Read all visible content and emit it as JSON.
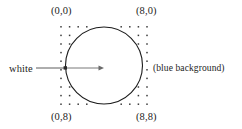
{
  "figure": {
    "corners": {
      "top_left": "(0,0)",
      "top_right": "(8,0)",
      "bottom_left": "(0,8)",
      "bottom_right": "(8,8)"
    },
    "annotations": {
      "seed_label": "white",
      "background_label": "(blue background)"
    },
    "colors": {
      "dot": "#3a3a3a",
      "outline": "#1c1c1c",
      "arrow": "#6a6a6a",
      "leader": "#4a4a4a",
      "page_background": "#ffffff"
    }
  },
  "chart_data": {
    "type": "scatter",
    "xlabel": "",
    "ylabel": "",
    "xlim": [
      0,
      8
    ],
    "ylim": [
      0,
      8
    ],
    "grid": false,
    "legend": "none",
    "grid_columns": 9,
    "grid_rows": 9,
    "x": [
      0,
      1,
      2,
      3,
      4,
      5,
      6,
      7,
      8
    ],
    "y": [
      0,
      1,
      2,
      3,
      4,
      5,
      6,
      7,
      8
    ],
    "shapes": [
      {
        "kind": "circle",
        "center": [
          4,
          4
        ],
        "radius": 4.0,
        "stroke": "#1c1c1c",
        "fill": "none"
      }
    ],
    "annotations": [
      {
        "text": "(0,0)",
        "x": 0,
        "y": 0,
        "position": "above-left"
      },
      {
        "text": "(8,0)",
        "x": 8,
        "y": 0,
        "position": "above-right"
      },
      {
        "text": "(0,8)",
        "x": 0,
        "y": 8,
        "position": "below-left"
      },
      {
        "text": "(8,8)",
        "x": 8,
        "y": 8,
        "position": "below-right"
      },
      {
        "text": "white",
        "x": 0,
        "y": 4,
        "position": "left",
        "arrow_to": [
          4,
          4
        ]
      },
      {
        "text": "(blue background)",
        "x": 8,
        "y": 4,
        "position": "right"
      }
    ],
    "seed_point": {
      "x": 0,
      "y": 4,
      "color": "white"
    }
  }
}
